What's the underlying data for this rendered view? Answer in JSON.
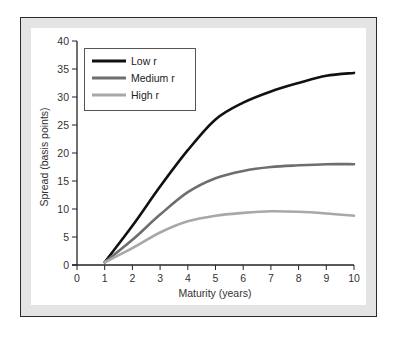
{
  "chart_data": {
    "type": "line",
    "title": "",
    "xlabel": "Maturity (years)",
    "ylabel": "Spread (basis points)",
    "xlim": [
      0,
      10
    ],
    "ylim": [
      0,
      40
    ],
    "x_ticks": [
      0,
      1,
      2,
      3,
      4,
      5,
      6,
      7,
      8,
      9,
      10
    ],
    "y_ticks": [
      0,
      5,
      10,
      15,
      20,
      25,
      30,
      35,
      40
    ],
    "grid": false,
    "legend_position": "upper left",
    "x": [
      1,
      2,
      3,
      4,
      5,
      6,
      7,
      8,
      9,
      10
    ],
    "series": [
      {
        "name": "Low r",
        "color": "#111111",
        "values": [
          0.5,
          7.0,
          14.0,
          20.5,
          26.0,
          29.0,
          31.0,
          32.5,
          33.8,
          34.3
        ]
      },
      {
        "name": "Medium r",
        "color": "#6e6e6e",
        "values": [
          0.5,
          4.5,
          9.0,
          13.0,
          15.5,
          16.8,
          17.5,
          17.8,
          18.0,
          18.0
        ]
      },
      {
        "name": "High r",
        "color": "#a8a8a8",
        "values": [
          0.5,
          3.0,
          5.8,
          7.8,
          8.8,
          9.3,
          9.6,
          9.5,
          9.2,
          8.8
        ]
      }
    ]
  }
}
